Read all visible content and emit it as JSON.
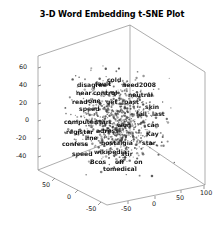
{
  "chart_data": {
    "type": "scatter",
    "title": "3-D Word Embedding t-SNE Plot",
    "projection": "3d",
    "xlabel": "",
    "ylabel": "",
    "zlabel": "",
    "grid": false,
    "legend": null,
    "marker_color": "#3a3a3a",
    "axis_color": "#8a8a8a",
    "background": "#ffffff",
    "axes": {
      "vertical_axis": {
        "name": "z",
        "ticks": [
          -40,
          -20,
          0,
          20,
          40,
          60
        ],
        "tick_labels": [
          "-40",
          "-20",
          "0",
          "20",
          "40",
          "60"
        ],
        "range": [
          -50,
          70
        ]
      },
      "left_bottom_axis": {
        "name": "y",
        "ticks": [
          50,
          0,
          -50
        ],
        "tick_labels": [
          "50",
          "0",
          "-50"
        ],
        "range": [
          -60,
          60
        ]
      },
      "right_bottom_axis": {
        "name": "x",
        "ticks": [
          -50,
          0,
          50,
          100
        ],
        "tick_labels": [
          "-50",
          "0",
          "50",
          "100"
        ],
        "range": [
          -60,
          110
        ]
      }
    },
    "point_count": 760,
    "cloud_extent_px": {
      "x0": 68,
      "x1": 168,
      "y0": 70,
      "y1": 172
    },
    "annotations": [
      {
        "text": "cold",
        "x": 107,
        "y": 76
      },
      {
        "text": "fault",
        "x": 95,
        "y": 80
      },
      {
        "text": "disagree",
        "x": 77,
        "y": 81
      },
      {
        "text": "need",
        "x": 122,
        "y": 81
      },
      {
        "text": "2008",
        "x": 139,
        "y": 81
      },
      {
        "text": "near",
        "x": 76,
        "y": 89
      },
      {
        "text": "control",
        "x": 93,
        "y": 89
      },
      {
        "text": "neutral",
        "x": 128,
        "y": 91
      },
      {
        "text": "read",
        "x": 72,
        "y": 98
      },
      {
        "text": "one",
        "x": 88,
        "y": 97
      },
      {
        "text": "get",
        "x": 106,
        "y": 98
      },
      {
        "text": "past",
        "x": 124,
        "y": 98
      },
      {
        "text": "speed",
        "x": 79,
        "y": 105
      },
      {
        "text": "skin",
        "x": 145,
        "y": 103
      },
      {
        "text": "fall",
        "x": 136,
        "y": 110
      },
      {
        "text": "last",
        "x": 152,
        "y": 110
      },
      {
        "text": "computer",
        "x": 64,
        "y": 118
      },
      {
        "text": "start",
        "x": 95,
        "y": 118
      },
      {
        "text": "won",
        "x": 117,
        "y": 121
      },
      {
        "text": "can",
        "x": 147,
        "y": 121
      },
      {
        "text": "register",
        "x": 66,
        "y": 128
      },
      {
        "text": "adress",
        "x": 96,
        "y": 127
      },
      {
        "text": "Kay",
        "x": 146,
        "y": 130
      },
      {
        "text": "line",
        "x": 85,
        "y": 134
      },
      {
        "text": "confess",
        "x": 62,
        "y": 140
      },
      {
        "text": "nostalgia",
        "x": 101,
        "y": 139
      },
      {
        "text": "star",
        "x": 142,
        "y": 139
      },
      {
        "text": "wikipedia",
        "x": 94,
        "y": 148
      },
      {
        "text": "speed",
        "x": 72,
        "y": 150
      },
      {
        "text": "stir",
        "x": 121,
        "y": 150
      },
      {
        "text": "Bcos",
        "x": 90,
        "y": 158
      },
      {
        "text": "off",
        "x": 115,
        "y": 158
      },
      {
        "text": "on",
        "x": 134,
        "y": 158
      },
      {
        "text": "to",
        "x": 103,
        "y": 165
      },
      {
        "text": "medical",
        "x": 110,
        "y": 165
      }
    ]
  }
}
